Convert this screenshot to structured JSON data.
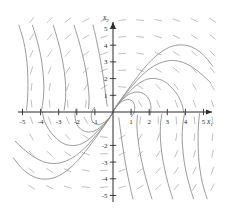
{
  "figure": {
    "kind": "phase-portrait",
    "background_color": "#ffffff",
    "axis_color": "#2b2b2b",
    "trajectory_color": "#8a8a8a",
    "field_color": "#b0b0b0"
  },
  "axes": {
    "x_label": "x",
    "x_label_sub": "1",
    "y_label": "x",
    "y_label_sub": "2",
    "x_ticks": [
      "-5",
      "-4",
      "-3",
      "-2",
      "-1",
      "1",
      "2",
      "3",
      "4",
      "5"
    ],
    "y_ticks": [
      "5",
      "4",
      "3",
      "2",
      "1",
      "-2",
      "-3",
      "-4",
      "-5"
    ]
  },
  "chart_data": {
    "type": "line",
    "title": "",
    "xlabel": "x1",
    "ylabel": "x2",
    "xlim": [
      -5.6,
      5.6
    ],
    "ylim": [
      -5.4,
      5.4
    ],
    "grid": false,
    "legend": "none",
    "equilibrium": {
      "x": 0,
      "y": 0,
      "classification": "spiral-focus"
    },
    "x_tick_values": [
      -5,
      -4,
      -3,
      -2,
      -1,
      1,
      2,
      3,
      4,
      5
    ],
    "y_tick_values": [
      5,
      4,
      3,
      2,
      1,
      -2,
      -3,
      -4,
      -5
    ],
    "annotations": [],
    "series": [
      {
        "name": "trajectory-1",
        "points": [
          [
            0.05,
            0.1
          ],
          [
            0.3,
            0.55
          ],
          [
            0.7,
            1.15
          ],
          [
            1.2,
            1.9
          ],
          [
            1.9,
            2.85
          ],
          [
            2.6,
            3.55
          ],
          [
            3.3,
            3.95
          ],
          [
            4.0,
            4.0
          ],
          [
            4.6,
            3.75
          ],
          [
            5.1,
            3.3
          ],
          [
            5.5,
            2.75
          ]
        ]
      },
      {
        "name": "trajectory-2",
        "points": [
          [
            0.04,
            0.08
          ],
          [
            0.25,
            0.45
          ],
          [
            0.6,
            0.95
          ],
          [
            1.05,
            1.55
          ],
          [
            1.6,
            2.2
          ],
          [
            2.25,
            2.75
          ],
          [
            2.95,
            3.05
          ],
          [
            3.6,
            3.05
          ],
          [
            4.2,
            2.8
          ],
          [
            4.8,
            2.35
          ],
          [
            5.4,
            1.75
          ]
        ]
      },
      {
        "name": "trajectory-3",
        "points": [
          [
            0.03,
            0.06
          ],
          [
            0.2,
            0.35
          ],
          [
            0.5,
            0.75
          ],
          [
            0.9,
            1.2
          ],
          [
            1.35,
            1.65
          ],
          [
            1.85,
            1.95
          ],
          [
            2.35,
            2.0
          ],
          [
            2.8,
            1.85
          ],
          [
            3.2,
            1.5
          ],
          [
            3.55,
            1.05
          ],
          [
            3.8,
            0.5
          ],
          [
            3.9,
            0.0
          ]
        ]
      },
      {
        "name": "trajectory-4",
        "points": [
          [
            0.02,
            0.05
          ],
          [
            0.15,
            0.28
          ],
          [
            0.38,
            0.58
          ],
          [
            0.68,
            0.9
          ],
          [
            1.0,
            1.12
          ],
          [
            1.35,
            1.2
          ],
          [
            1.65,
            1.12
          ],
          [
            1.9,
            0.9
          ],
          [
            2.05,
            0.58
          ],
          [
            2.1,
            0.2
          ],
          [
            2.05,
            -0.2
          ]
        ]
      },
      {
        "name": "trajectory-5",
        "points": [
          [
            0.015,
            0.04
          ],
          [
            0.1,
            0.2
          ],
          [
            0.26,
            0.4
          ],
          [
            0.46,
            0.6
          ],
          [
            0.68,
            0.72
          ],
          [
            0.9,
            0.74
          ],
          [
            1.08,
            0.64
          ],
          [
            1.18,
            0.44
          ],
          [
            1.2,
            0.2
          ],
          [
            1.15,
            -0.05
          ],
          [
            1.02,
            -0.28
          ]
        ]
      },
      {
        "name": "trajectory-6",
        "points": [
          [
            -0.05,
            -0.1
          ],
          [
            -0.3,
            -0.55
          ],
          [
            -0.7,
            -1.15
          ],
          [
            -1.2,
            -1.9
          ],
          [
            -1.9,
            -2.85
          ],
          [
            -2.6,
            -3.55
          ],
          [
            -3.3,
            -3.95
          ],
          [
            -4.0,
            -4.0
          ],
          [
            -4.6,
            -3.75
          ],
          [
            -5.1,
            -3.3
          ],
          [
            -5.5,
            -2.75
          ]
        ]
      },
      {
        "name": "trajectory-7",
        "points": [
          [
            -0.04,
            -0.08
          ],
          [
            -0.25,
            -0.45
          ],
          [
            -0.6,
            -0.95
          ],
          [
            -1.05,
            -1.55
          ],
          [
            -1.6,
            -2.2
          ],
          [
            -2.25,
            -2.75
          ],
          [
            -2.95,
            -3.05
          ],
          [
            -3.6,
            -3.05
          ],
          [
            -4.2,
            -2.8
          ],
          [
            -4.8,
            -2.35
          ],
          [
            -5.4,
            -1.75
          ]
        ]
      },
      {
        "name": "trajectory-8",
        "points": [
          [
            -0.03,
            -0.06
          ],
          [
            -0.2,
            -0.35
          ],
          [
            -0.5,
            -0.75
          ],
          [
            -0.9,
            -1.2
          ],
          [
            -1.35,
            -1.65
          ],
          [
            -1.85,
            -1.95
          ],
          [
            -2.35,
            -2.0
          ],
          [
            -2.8,
            -1.85
          ],
          [
            -3.2,
            -1.5
          ],
          [
            -3.55,
            -1.05
          ],
          [
            -3.8,
            -0.5
          ],
          [
            -3.9,
            0.0
          ]
        ]
      },
      {
        "name": "trajectory-9",
        "points": [
          [
            -0.02,
            -0.05
          ],
          [
            -0.15,
            -0.28
          ],
          [
            -0.38,
            -0.58
          ],
          [
            -0.68,
            -0.9
          ],
          [
            -1.0,
            -1.12
          ],
          [
            -1.35,
            -1.2
          ],
          [
            -1.65,
            -1.12
          ],
          [
            -1.9,
            -0.9
          ],
          [
            -2.05,
            -0.58
          ],
          [
            -2.1,
            -0.2
          ],
          [
            -2.05,
            0.2
          ]
        ]
      },
      {
        "name": "trajectory-10",
        "points": [
          [
            -0.015,
            -0.04
          ],
          [
            -0.1,
            -0.2
          ],
          [
            -0.26,
            -0.4
          ],
          [
            -0.46,
            -0.6
          ],
          [
            -0.68,
            -0.72
          ],
          [
            -0.9,
            -0.74
          ],
          [
            -1.08,
            -0.64
          ],
          [
            -1.18,
            -0.44
          ],
          [
            -1.2,
            -0.2
          ],
          [
            -1.15,
            0.05
          ],
          [
            -1.02,
            0.28
          ]
        ]
      },
      {
        "name": "trajectory-11",
        "points": [
          [
            -5.2,
            5.2
          ],
          [
            -4.95,
            4.3
          ],
          [
            -4.8,
            3.4
          ],
          [
            -4.72,
            2.5
          ],
          [
            -4.7,
            1.6
          ],
          [
            -4.72,
            0.8
          ],
          [
            -4.78,
            0.1
          ]
        ]
      },
      {
        "name": "trajectory-12",
        "points": [
          [
            -4.45,
            5.2
          ],
          [
            -4.2,
            4.3
          ],
          [
            -4.0,
            3.4
          ],
          [
            -3.88,
            2.5
          ],
          [
            -3.82,
            1.6
          ],
          [
            -3.85,
            0.8
          ],
          [
            -3.95,
            0.1
          ]
        ]
      },
      {
        "name": "trajectory-13",
        "points": [
          [
            -3.3,
            5.2
          ],
          [
            -3.05,
            4.3
          ],
          [
            -2.85,
            3.4
          ],
          [
            -2.7,
            2.5
          ],
          [
            -2.62,
            1.6
          ],
          [
            -2.62,
            0.8
          ],
          [
            -2.7,
            0.12
          ]
        ]
      },
      {
        "name": "trajectory-14",
        "points": [
          [
            -2.15,
            5.2
          ],
          [
            -1.9,
            4.3
          ],
          [
            -1.68,
            3.4
          ],
          [
            -1.5,
            2.5
          ],
          [
            -1.38,
            1.6
          ],
          [
            -1.32,
            0.85
          ],
          [
            -1.35,
            0.2
          ]
        ]
      },
      {
        "name": "trajectory-15",
        "points": [
          [
            -1.1,
            5.2
          ],
          [
            -0.92,
            4.35
          ],
          [
            -0.76,
            3.5
          ],
          [
            -0.62,
            2.65
          ],
          [
            -0.5,
            1.8
          ],
          [
            -0.4,
            1.0
          ],
          [
            -0.32,
            0.35
          ]
        ]
      },
      {
        "name": "trajectory-16",
        "points": [
          [
            5.2,
            -5.2
          ],
          [
            4.95,
            -4.3
          ],
          [
            4.8,
            -3.4
          ],
          [
            4.72,
            -2.5
          ],
          [
            4.7,
            -1.6
          ],
          [
            4.72,
            -0.8
          ],
          [
            4.78,
            -0.1
          ]
        ]
      },
      {
        "name": "trajectory-17",
        "points": [
          [
            4.45,
            -5.2
          ],
          [
            4.2,
            -4.3
          ],
          [
            4.0,
            -3.4
          ],
          [
            3.88,
            -2.5
          ],
          [
            3.82,
            -1.6
          ],
          [
            3.85,
            -0.8
          ],
          [
            3.95,
            -0.1
          ]
        ]
      },
      {
        "name": "trajectory-18",
        "points": [
          [
            3.3,
            -5.2
          ],
          [
            3.05,
            -4.3
          ],
          [
            2.85,
            -3.4
          ],
          [
            2.7,
            -2.5
          ],
          [
            2.62,
            -1.6
          ],
          [
            2.62,
            -0.8
          ],
          [
            2.7,
            -0.12
          ]
        ]
      },
      {
        "name": "trajectory-19",
        "points": [
          [
            2.15,
            -5.2
          ],
          [
            1.9,
            -4.3
          ],
          [
            1.68,
            -3.4
          ],
          [
            1.5,
            -2.5
          ],
          [
            1.38,
            -1.6
          ],
          [
            1.32,
            -0.85
          ],
          [
            1.35,
            -0.2
          ]
        ]
      },
      {
        "name": "trajectory-20",
        "points": [
          [
            1.1,
            -5.2
          ],
          [
            0.92,
            -4.35
          ],
          [
            0.76,
            -3.5
          ],
          [
            0.62,
            -2.65
          ],
          [
            0.5,
            -1.8
          ],
          [
            0.4,
            -1.0
          ],
          [
            0.32,
            -0.35
          ]
        ]
      }
    ],
    "direction_field": {
      "description": "short dashed slope segments on a grid",
      "grid_x": [
        -5,
        -4,
        -3,
        -2,
        -1,
        0,
        1,
        2,
        3,
        4,
        5
      ],
      "grid_y": [
        -5,
        -4,
        -3,
        -2,
        -1,
        0,
        1,
        2,
        3,
        4,
        5
      ],
      "dash_length": 7
    }
  }
}
